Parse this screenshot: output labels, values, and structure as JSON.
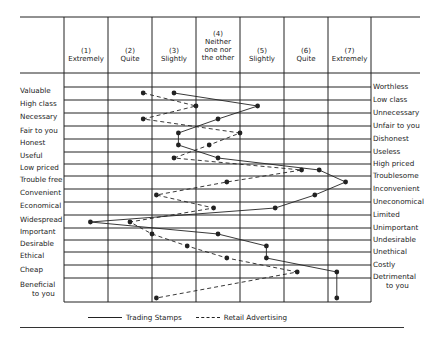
{
  "chart_data": {
    "type": "line",
    "title": "",
    "xlabel": "",
    "ylabel": "",
    "scale_headers": [
      {
        "num": "(1)",
        "text": "Extremely"
      },
      {
        "num": "(2)",
        "text": "Quite"
      },
      {
        "num": "(3)",
        "text": "Slightly"
      },
      {
        "num": "(4)",
        "text": "Neither one nor the other"
      },
      {
        "num": "(5)",
        "text": "Slightly"
      },
      {
        "num": "(6)",
        "text": "Quite"
      },
      {
        "num": "(7)",
        "text": "Extremely"
      }
    ],
    "xlim": [
      1,
      7
    ],
    "left_attributes": [
      "Valuable",
      "High class",
      "Necessary",
      "Fair to you",
      "Honest",
      "Useful",
      "Low priced",
      "Trouble free",
      "Convenient",
      "Economical",
      "Widespread",
      "Important",
      "Desirable",
      "Ethical",
      "Cheap",
      "Beneficial to you"
    ],
    "right_attributes": [
      "Worthless",
      "Low class",
      "Unnecessary",
      "Unfair to you",
      "Dishonest",
      "Useless",
      "High priced",
      "Troublesome",
      "Inconvenient",
      "Uneconomical",
      "Limited",
      "Unimportant",
      "Undesirable",
      "Unethical",
      "Costly",
      "Detrimental to you"
    ],
    "series": [
      {
        "name": "Trading Stamps",
        "style": "solid",
        "values": [
          3.0,
          4.9,
          4.0,
          3.1,
          3.1,
          4.0,
          6.3,
          6.9,
          6.2,
          5.3,
          1.1,
          4.0,
          5.1,
          5.1,
          6.7,
          6.7
        ]
      },
      {
        "name": "Retail Advertising",
        "style": "dashed",
        "values": [
          2.3,
          3.5,
          2.3,
          4.5,
          3.8,
          3.0,
          5.9,
          4.2,
          2.6,
          3.9,
          2.0,
          2.5,
          3.3,
          4.2,
          5.8,
          2.6
        ]
      }
    ],
    "grid": true,
    "legend_position": "bottom"
  },
  "legend": {
    "solid_label": "Trading Stamps",
    "dashed_label": "Retail Advertising"
  },
  "colors": {
    "ink": "#222222",
    "background": "#ffffff"
  }
}
